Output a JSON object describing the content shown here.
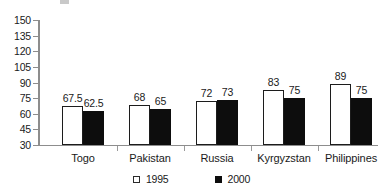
{
  "chart_data": {
    "type": "bar",
    "title": "",
    "subtitle": "",
    "xlabel": "",
    "ylabel": "",
    "categories": [
      "Togo",
      "Pakistan",
      "Russia",
      "Kyrgyzstan",
      "Philippines"
    ],
    "series": [
      {
        "name": "1995",
        "color": "#ffffff",
        "values": [
          67.5,
          68,
          72,
          83,
          89
        ],
        "labels": [
          "67.5",
          "68",
          "72",
          "83",
          "89"
        ]
      },
      {
        "name": "2000",
        "color": "#0d0d0d",
        "values": [
          62.5,
          65,
          73,
          75,
          75
        ],
        "labels": [
          "62.5",
          "65",
          "73",
          "75",
          "75"
        ]
      }
    ],
    "ylim": [
      30,
      150
    ],
    "yticks": [
      30,
      45,
      60,
      75,
      90,
      105,
      120,
      135,
      150
    ],
    "ytick_labels": [
      "30",
      "45",
      "60",
      "75",
      "90",
      "105",
      "120",
      "135",
      "150"
    ],
    "grid": false,
    "legend_position": "bottom",
    "legend": [
      {
        "label": "1995",
        "swatch": "hollow-square-icon"
      },
      {
        "label": "2000",
        "swatch": "filled-square-icon"
      }
    ]
  }
}
